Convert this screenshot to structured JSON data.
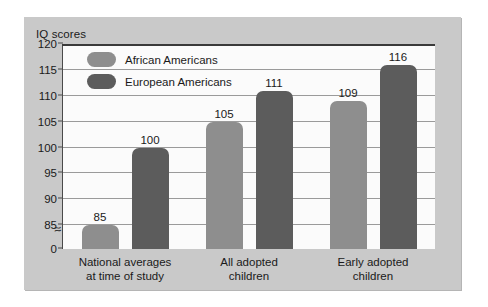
{
  "chart_data": {
    "type": "bar",
    "title": "IQ scores",
    "xlabel": "",
    "ylabel": "IQ scores",
    "categories": [
      "National averages\nat time of study",
      "All adopted\nchildren",
      "Early adopted\nchildren"
    ],
    "category_lines": [
      [
        "National averages",
        "at time of study"
      ],
      [
        "All adopted",
        "children"
      ],
      [
        "Early adopted",
        "children"
      ]
    ],
    "series": [
      {
        "name": "African Americans",
        "color": "#8e8e8e",
        "values": [
          85,
          105,
          109
        ]
      },
      {
        "name": "European Americans",
        "color": "#5c5c5c",
        "values": [
          100,
          111,
          116
        ]
      }
    ],
    "ylim": [
      0,
      120
    ],
    "yticks": [
      120,
      115,
      110,
      105,
      100,
      95,
      90,
      85,
      0
    ],
    "ytick_labels": [
      "120",
      "115",
      "110",
      "105",
      "100",
      "95",
      "90",
      "85",
      "0"
    ],
    "axis_break": {
      "symbol": "≈",
      "between": [
        85,
        0
      ]
    },
    "grid": true,
    "grid_axis": "y",
    "legend": {
      "position": "inside-top-left",
      "entries": [
        {
          "label": "African Americans",
          "color": "#8e8e8e"
        },
        {
          "label": "European Americans",
          "color": "#5c5c5c"
        }
      ]
    },
    "bar_value_labels": [
      [
        "85",
        "100"
      ],
      [
        "105",
        "111"
      ],
      [
        "109",
        "116"
      ]
    ],
    "panel_color": "#c9c9c9",
    "plot_color": "#fbfbfb"
  }
}
